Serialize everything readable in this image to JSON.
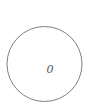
{
  "diagram": {
    "type": "single-node",
    "node": {
      "label": "0",
      "shape": "circle",
      "stroke_color": "#808080",
      "fill_color": "#ffffff"
    }
  }
}
